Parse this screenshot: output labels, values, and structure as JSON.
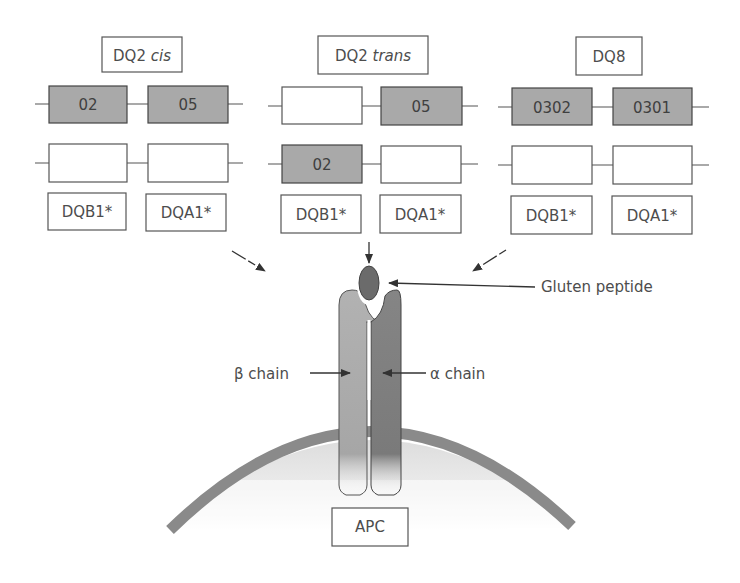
{
  "haplotypes": [
    {
      "title_main": "DQ2 ",
      "title_italic": "cis",
      "row1": {
        "left": "02",
        "right": "05",
        "left_filled": true,
        "right_filled": true
      },
      "row2": {
        "left": "",
        "right": "",
        "left_filled": false,
        "right_filled": false
      },
      "gene_labels": [
        "DQB1*",
        "DQA1*"
      ]
    },
    {
      "title_main": "DQ2 ",
      "title_italic": "trans",
      "row1": {
        "left": "",
        "right": "05",
        "left_filled": false,
        "right_filled": true
      },
      "row2": {
        "left": "02",
        "right": "",
        "left_filled": true,
        "right_filled": false
      },
      "gene_labels": [
        "DQB1*",
        "DQA1*"
      ]
    },
    {
      "title_main": "DQ8",
      "title_italic": "",
      "row1": {
        "left": "0302",
        "right": "0301",
        "left_filled": true,
        "right_filled": true
      },
      "row2": {
        "left": "",
        "right": "",
        "left_filled": false,
        "right_filled": false
      },
      "gene_labels": [
        "DQB1*",
        "DQA1*"
      ]
    }
  ],
  "molecule": {
    "peptide_label": "Gluten peptide",
    "beta_label": "β chain",
    "alpha_label": "α chain",
    "cell_label": "APC"
  },
  "colors": {
    "allele_fill": "#a9a9a9",
    "beta_chain": "#a6a6a6",
    "alpha_chain": "#7d7d7d",
    "peptide": "#6b6b6b",
    "membrane": "#8a8a8a",
    "box_stroke": "#555555"
  }
}
